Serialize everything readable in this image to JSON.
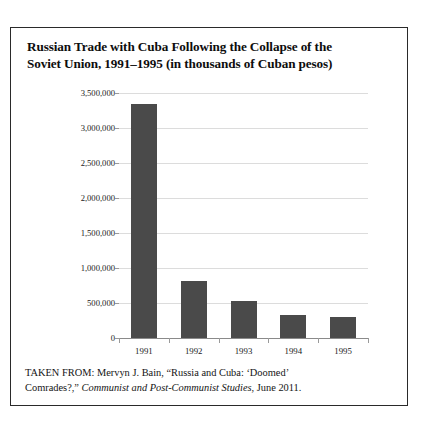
{
  "title": {
    "line1": "Russian Trade with Cuba Following the Collapse of the",
    "line2": "Soviet Union, 1991–1995 (in thousands of Cuban pesos)"
  },
  "caption": {
    "line1_prefix": "TAKEN FROM: Mervyn J. Bain, “Russia and Cuba: ‘Doomed’",
    "line2_prefix": "Comrades?,” ",
    "line2_italic": "Communist and Post-Communist Studies",
    "line2_suffix": ", June 2011."
  },
  "colors": {
    "bar_fill": "#4a4a4a",
    "gridline": "#dcdcdc",
    "axis": "#8a8a8a",
    "border": "#2a2a2a",
    "text": "#0d0d0d"
  },
  "chart_data": {
    "type": "bar",
    "title": "Russian Trade with Cuba Following the Collapse of the Soviet Union, 1991–1995 (in thousands of Cuban pesos)",
    "xlabel": "",
    "ylabel": "",
    "categories": [
      "1991",
      "1992",
      "1993",
      "1994",
      "1995"
    ],
    "values": [
      3350000,
      815000,
      530000,
      330000,
      300000
    ],
    "ylim": [
      0,
      3500000
    ],
    "ytick_values": [
      0,
      500000,
      1000000,
      1500000,
      2000000,
      2500000,
      3000000,
      3500000
    ],
    "ytick_labels": [
      "0",
      "500,000",
      "1,000,000",
      "1,500,000",
      "2,000,000",
      "2,500,000",
      "3,000,000",
      "3,500,000"
    ],
    "grid": true,
    "legend": false,
    "series": [
      {
        "name": "Russian trade with Cuba",
        "values": [
          3350000,
          815000,
          530000,
          330000,
          300000
        ]
      }
    ]
  }
}
